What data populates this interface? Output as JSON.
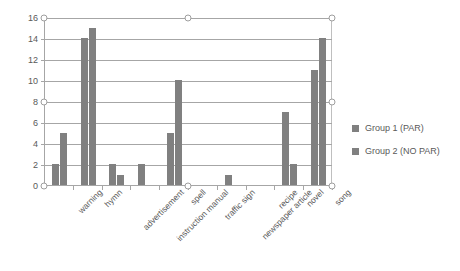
{
  "chart_data": {
    "type": "bar",
    "title": "",
    "xlabel": "",
    "ylabel": "",
    "ylim": [
      0,
      16
    ],
    "ytick_step": 2,
    "yticks": [
      0,
      2,
      4,
      6,
      8,
      10,
      12,
      14,
      16
    ],
    "grid": true,
    "legend_position": "right",
    "bar_color": "#808080",
    "categories": [
      "warning",
      "hymn",
      "advertisement",
      "instruction manual",
      "spell",
      "traffic sign",
      "newspaper article",
      "recipe",
      "novel",
      "song"
    ],
    "series": [
      {
        "name": "Group 1 (PAR)",
        "color": "#808080",
        "values": [
          2,
          14,
          2,
          2,
          5,
          0,
          1,
          0,
          7,
          11
        ]
      },
      {
        "name": "Group 2 (NO PAR)",
        "color": "#808080",
        "values": [
          5,
          15,
          1,
          0,
          10,
          0,
          0,
          0,
          2,
          14
        ]
      }
    ]
  },
  "legend": {
    "items": [
      {
        "label": "Group 1 (PAR)"
      },
      {
        "label": "Group 2 (NO PAR)"
      }
    ]
  }
}
